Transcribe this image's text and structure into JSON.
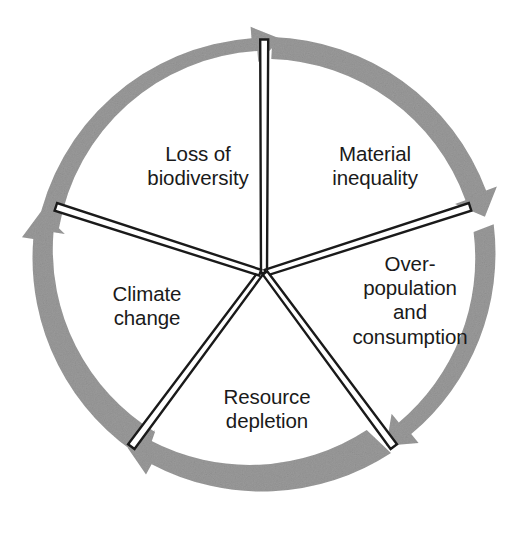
{
  "diagram": {
    "type": "cyclic-process-diagram",
    "title": "",
    "shape": "pentagon-segmented-circle",
    "direction": "clockwise",
    "colors": {
      "arrow_ring": "#9a9a9a",
      "spoke_line": "#1a1a1a",
      "text": "#1a1a1a",
      "background": "#ffffff"
    },
    "geometry": {
      "center_x": 264,
      "center_y": 273,
      "outer_radius": 236,
      "band_width": 22,
      "segment_count": 5,
      "spoke_angles_deg": [
        -90,
        -18,
        54,
        126,
        198
      ]
    },
    "segments": [
      {
        "id": "material-inequality",
        "label": "Material\ninequality",
        "position": "top-right",
        "arrowhead": "clockwise-end"
      },
      {
        "id": "overpopulation-and-consumption",
        "label": "Over-\npopulation\nand\nconsumption",
        "position": "right",
        "arrowhead": "clockwise-end"
      },
      {
        "id": "resource-depletion",
        "label": "Resource\ndepletion",
        "position": "bottom",
        "arrowhead": "clockwise-end"
      },
      {
        "id": "climate-change",
        "label": "Climate\nchange",
        "position": "left",
        "arrowhead": "clockwise-end"
      },
      {
        "id": "loss-of-biodiversity",
        "label": "Loss of\nbiodiversity",
        "position": "top-left",
        "arrowhead": "clockwise-end"
      }
    ]
  }
}
